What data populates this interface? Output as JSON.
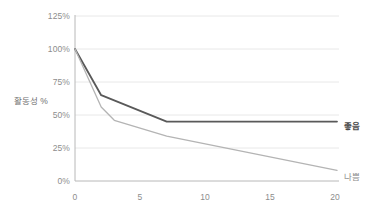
{
  "chart_data": {
    "type": "line",
    "title": "",
    "xlabel": "",
    "ylabel": "활동성 %",
    "xlim": [
      0,
      20
    ],
    "ylim": [
      0,
      125
    ],
    "grid": true,
    "legend_position": "right-inline",
    "x_ticks": [
      "0",
      "5",
      "10",
      "15",
      "20"
    ],
    "x_tick_values": [
      0,
      5,
      10,
      15,
      20
    ],
    "y_ticks": [
      "0%",
      "25%",
      "50%",
      "75%",
      "100%",
      "125%"
    ],
    "y_tick_values": [
      0,
      25,
      50,
      75,
      100,
      125
    ],
    "series": [
      {
        "name": "좋음",
        "color": "#595959",
        "width": 1.8,
        "x": [
          0,
          2,
          7,
          20
        ],
        "values": [
          100,
          65,
          45,
          45
        ]
      },
      {
        "name": "나쁨",
        "color": "#b4b4b4",
        "width": 1.3,
        "x": [
          0,
          2,
          3,
          7,
          20
        ],
        "values": [
          100,
          56,
          46,
          34,
          8
        ]
      }
    ]
  },
  "axis": {
    "y_title": "활동성 %"
  },
  "legend": {
    "good_label": "좋음",
    "bad_label": "나쁨"
  },
  "colors": {
    "good_line": "#595959",
    "bad_line": "#b4b4b4",
    "grid": "#e8e8e8",
    "axis": "#b8b8b8",
    "text": "#8d8d8d",
    "background": "#ffffff"
  }
}
